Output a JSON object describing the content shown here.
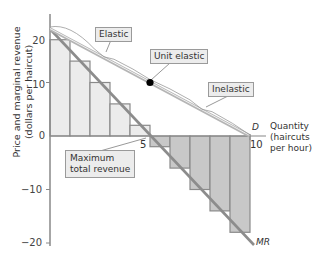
{
  "chart_data": {
    "type": "bar",
    "title": "",
    "xlabel": "Quantity (haircuts per hour)",
    "ylabel": "Price and marginal revenue (dollars per haircut)",
    "xlim": [
      0,
      10
    ],
    "ylim": [
      -20,
      22
    ],
    "x_ticks": [
      "0",
      "5",
      "10"
    ],
    "y_ticks": [
      "20",
      "10",
      "0",
      "-10",
      "-20"
    ],
    "categories": [
      "0-1",
      "1-2",
      "2-3",
      "3-4",
      "4-5",
      "5-6",
      "6-7",
      "7-8",
      "8-9",
      "9-10"
    ],
    "values": [
      18,
      14,
      10,
      6,
      2,
      -2,
      -6,
      -10,
      -14,
      -18
    ],
    "series": [
      {
        "name": "D",
        "type": "line",
        "x": [
          0,
          10
        ],
        "y": [
          20,
          0
        ]
      },
      {
        "name": "MR",
        "type": "line",
        "x": [
          0,
          10
        ],
        "y": [
          20,
          -20
        ]
      },
      {
        "name": "Marginal revenue bars",
        "type": "bar",
        "values": [
          18,
          14,
          10,
          6,
          2,
          -2,
          -6,
          -10,
          -14,
          -18
        ]
      }
    ],
    "annotations": [
      {
        "text": "Elastic",
        "region": "Q 0-5"
      },
      {
        "text": "Unit elastic",
        "point": [
          5,
          10
        ]
      },
      {
        "text": "Inelastic",
        "region": "Q 5-10"
      },
      {
        "text": "Maximum total revenue",
        "point": [
          5,
          0
        ]
      }
    ],
    "grid": false,
    "legend": "none"
  },
  "axis": {
    "y_label_line1": "Price and marginal revenue",
    "y_label_line2": "(dollars per haircut)",
    "x_label_line1": "Quantity",
    "x_label_line2": "(haircuts",
    "x_label_line3": "per hour)",
    "y_ticks": {
      "t20": "20",
      "t10": "10",
      "t0": "0",
      "tm10": "−10",
      "tm20": "−20"
    },
    "x_ticks": {
      "t5": "5",
      "t10": "10"
    }
  },
  "labels": {
    "elastic": "Elastic",
    "unit_elastic": "Unit elastic",
    "inelastic": "Inelastic",
    "max_tr_line1": "Maximum",
    "max_tr_line2": "total revenue",
    "demand": "D",
    "mr": "MR"
  },
  "colors": {
    "bar_fill_positive": "#ececec",
    "bar_fill_negative": "#c8c8c8",
    "bar_stroke": "#8a8a8a",
    "demand_line": "#b5b5b5",
    "mr_line": "#8c8c8c",
    "axis": "#888888",
    "point": "#000000"
  }
}
